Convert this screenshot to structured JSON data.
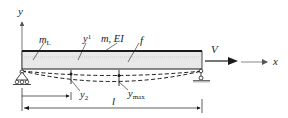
{
  "figure": {
    "type": "beam-vehicle diagram",
    "axes": {
      "y_label": "y",
      "x_label": "x"
    },
    "labels": {
      "mass_L": {
        "base": "m",
        "sub": "L"
      },
      "y1": {
        "base": "y",
        "sub": "1"
      },
      "beam_props": "m, EI",
      "f": "f",
      "velocity": "V",
      "y2": {
        "base": "y",
        "sub": "2"
      },
      "ymax": {
        "base": "y",
        "sub": "max"
      },
      "dim_x": "x",
      "dim_l": "l"
    },
    "colors": {
      "line": "#1a1a1a",
      "beam_fill": "#e6e6e6",
      "axis_gray": "#8a8a8a"
    }
  }
}
